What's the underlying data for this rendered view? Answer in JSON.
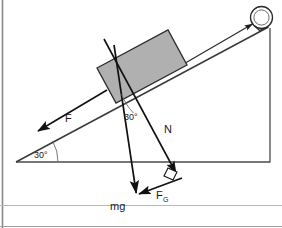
{
  "figure": {
    "background_color": "#ffffff",
    "border_color": "#8a8a8a",
    "line_color": "#3a3a3a",
    "vector_color": "#111111",
    "block_fill": "#b0b0b0",
    "block_stroke": "#2b2b2b"
  },
  "labels": {
    "incline_angle": "30°",
    "normal_angle": "30°",
    "friction_force": "F",
    "normal_force": "N",
    "weight": "mg",
    "weight_component_symbol": "F",
    "weight_component_subscript": "G"
  },
  "elements": {
    "pulley_name": "pulley",
    "rope_name": "rope",
    "block_name": "block",
    "incline_name": "inclined-plane",
    "right_angle_marker": "right-angle-marker"
  },
  "geometry": {
    "incline_angle_degrees": 30,
    "baseline": {
      "x1": 16,
      "y1": 162,
      "x2": 270,
      "y2": 162
    },
    "incline_surface": {
      "x1": 16,
      "y1": 162,
      "x2": 268,
      "y2": 27
    },
    "vertical_edge": {
      "x1": 270,
      "y1": 162,
      "x2": 270,
      "y2": 28
    },
    "pulley_center": {
      "cx": 262,
      "cy": 18,
      "r": 11
    },
    "weight_vector": {
      "x1": 114,
      "y1": 45,
      "x2": 136,
      "y2": 196
    },
    "normal_vector": {
      "x1": 104,
      "y1": 39,
      "x2": 177,
      "y2": 175
    },
    "friction_vector": {
      "x1": 107,
      "y1": 90,
      "x2": 37,
      "y2": 131
    },
    "fg_vector": {
      "x1": 180,
      "y1": 179,
      "x2": 137,
      "y2": 196
    }
  }
}
